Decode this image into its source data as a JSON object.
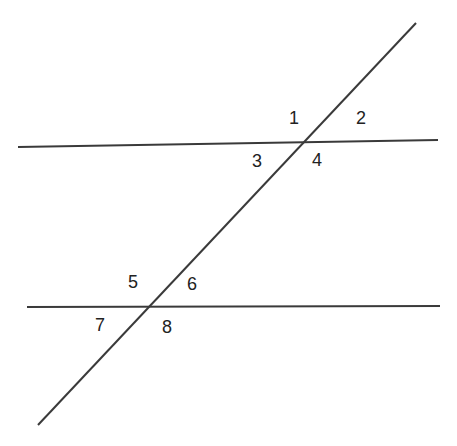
{
  "diagram": {
    "type": "parallel-lines-cut-by-transversal",
    "line_color": "#3a3a3a",
    "label_color": "#222222",
    "lines": [
      {
        "name": "upper-parallel-line",
        "x1": 18,
        "y1": 147,
        "x2": 438,
        "y2": 140
      },
      {
        "name": "lower-parallel-line",
        "x1": 27,
        "y1": 307,
        "x2": 440,
        "y2": 306
      },
      {
        "name": "transversal-line",
        "x1": 38,
        "y1": 425,
        "x2": 416,
        "y2": 23
      }
    ],
    "labels": [
      {
        "text": "1",
        "x": 289,
        "y": 124
      },
      {
        "text": "2",
        "x": 356,
        "y": 124
      },
      {
        "text": "3",
        "x": 252,
        "y": 167
      },
      {
        "text": "4",
        "x": 312,
        "y": 166
      },
      {
        "text": "5",
        "x": 128,
        "y": 288
      },
      {
        "text": "6",
        "x": 187,
        "y": 290
      },
      {
        "text": "7",
        "x": 95,
        "y": 331
      },
      {
        "text": "8",
        "x": 162,
        "y": 333
      }
    ]
  }
}
